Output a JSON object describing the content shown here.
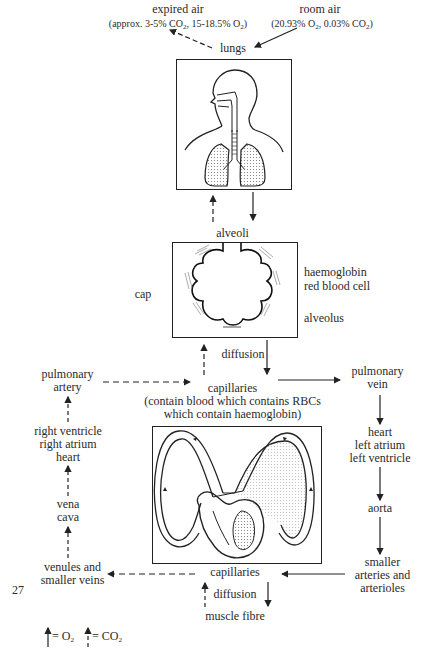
{
  "header_cutoff": "Figure ... oxygen ... carbon dioxide ... (cut off)",
  "top": {
    "expired_air": {
      "title": "expired air",
      "detail": "(approx. 3-5% CO2, 15-18.5% O2)"
    },
    "room_air": {
      "title": "room air",
      "detail": "(20.93% O2, 0.03% CO2)"
    },
    "lungs": "lungs"
  },
  "alveoli": {
    "label": "alveoli",
    "cap": "cap",
    "haemoglobin": "haemoglobin",
    "red_blood_cell": "red blood cell",
    "alveolus": "alveolus",
    "diffusion": "diffusion"
  },
  "circulation": {
    "pulmonary_artery": [
      "pulmonary",
      "artery"
    ],
    "pulmonary_vein": [
      "pulmonary",
      "vein"
    ],
    "capillaries_lung": [
      "capillaries",
      "(contain blood which contains RBCs",
      "which contain haemoglobin)"
    ],
    "right_heart": [
      "right ventricle",
      "right atrium",
      "heart"
    ],
    "left_heart": [
      "heart",
      "left atrium",
      "left ventricle"
    ],
    "vena_cava": [
      "vena",
      "cava"
    ],
    "aorta": "aorta",
    "venules": [
      "venules and",
      "smaller veins"
    ],
    "arteries": [
      "smaller",
      "arteries and",
      "arterioles"
    ],
    "capillaries_muscle": "capillaries",
    "diffusion_muscle": "diffusion",
    "muscle_fibre": "muscle fibre"
  },
  "page_number": "27",
  "legend": {
    "solid": "= O2",
    "dashed": "= CO2"
  },
  "colors": {
    "line": "#222222",
    "stipple": "#9a9a9a",
    "text": "#2a2a2a"
  }
}
